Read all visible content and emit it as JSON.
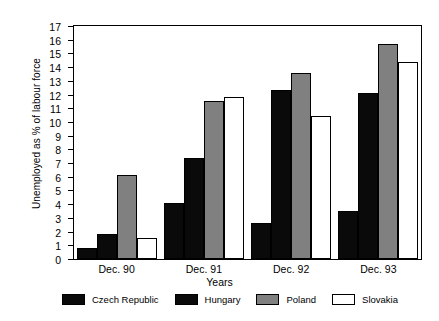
{
  "chart_data": {
    "type": "bar",
    "title": "",
    "xlabel": "Years",
    "ylabel": "Unemployed as % of labour force",
    "categories": [
      "Dec. 90",
      "Dec. 91",
      "Dec. 92",
      "Dec. 93"
    ],
    "ylim": [
      0,
      17
    ],
    "ytick_step": 1,
    "yticks": [
      "0",
      "1",
      "2",
      "3",
      "4",
      "5",
      "6",
      "7",
      "8",
      "9",
      "10",
      "11",
      "12",
      "13",
      "14",
      "15",
      "16",
      "17"
    ],
    "grid": false,
    "legend_position": "bottom",
    "series": [
      {
        "name": "Czech Republic",
        "color": "#0a0a0a",
        "fill": "black",
        "values": [
          0.8,
          4.1,
          2.6,
          3.5
        ]
      },
      {
        "name": "Hungary",
        "color": "#0a0a0a",
        "fill": "black",
        "values": [
          1.8,
          7.4,
          12.3,
          12.1
        ]
      },
      {
        "name": "Poland",
        "color": "#808080",
        "fill": "grey",
        "values": [
          6.1,
          11.5,
          13.6,
          15.7
        ]
      },
      {
        "name": "Slovakia",
        "color": "#ffffff",
        "fill": "white",
        "values": [
          1.5,
          11.8,
          10.4,
          14.4
        ]
      }
    ]
  }
}
